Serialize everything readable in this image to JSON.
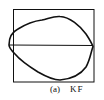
{
  "figure": {
    "label": "(a)",
    "name": "KF",
    "colors": {
      "stroke": "#111111",
      "background": "#ffffff"
    }
  }
}
